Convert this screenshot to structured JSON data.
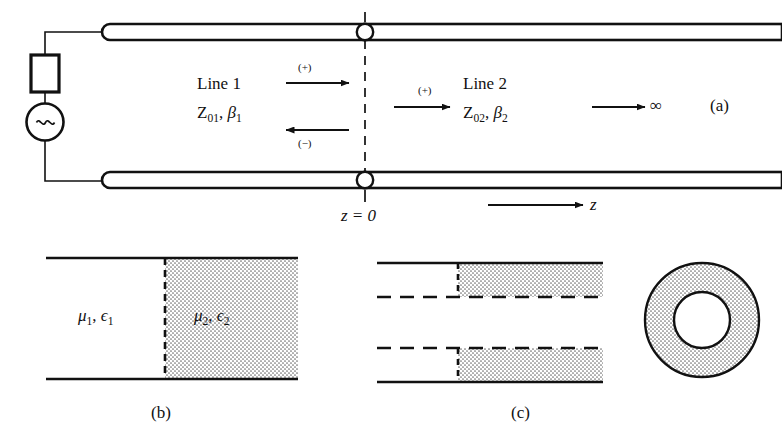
{
  "figure": {
    "stroke_color": "#111111",
    "fill_white": "#ffffff",
    "hatch_color": "#9a9a9a",
    "background": "#ffffff"
  },
  "panel_a": {
    "part_label": "(a)",
    "line1": {
      "name": "Line 1",
      "params_Z": "Z",
      "params_Z_sub": "01",
      "comma": ", ",
      "params_beta": "β",
      "params_beta_sub": "1",
      "forward_marker": "(+)",
      "backward_marker": "(−)"
    },
    "line2": {
      "name": "Line 2",
      "params_Z": "Z",
      "params_Z_sub": "02",
      "comma": ", ",
      "params_beta": "β",
      "params_beta_sub": "2",
      "forward_marker": "(+)",
      "termination": "∞"
    },
    "junction_label": "z = 0",
    "axis_label": "z",
    "source": {
      "generator_icon": "ac-source-icon",
      "generator_symbol": "∼",
      "resistor_icon": "resistor-icon"
    }
  },
  "panel_b": {
    "part_label": "(b)",
    "region1": {
      "mu": "μ",
      "mu_sub": "1",
      "comma": ", ",
      "eps": "ϵ",
      "eps_sub": "1"
    },
    "region2": {
      "mu": "μ",
      "mu_sub": "2",
      "comma": ", ",
      "eps": "ϵ",
      "eps_sub": "2"
    }
  },
  "panel_c": {
    "part_label": "(c)",
    "description": "coaxial line longitudinal section with dielectric discontinuity"
  },
  "panel_d": {
    "description": "coaxial line cross section annulus"
  }
}
